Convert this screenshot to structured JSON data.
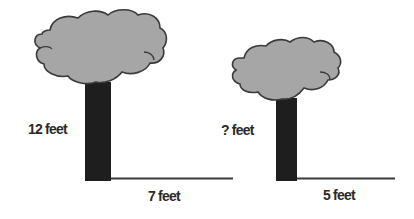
{
  "diagram": {
    "colors": {
      "canopy_fill": "#a6a6a6",
      "canopy_stroke": "#3a3a3a",
      "trunk": "#1e1e1e",
      "ground_line": "#3a3a3a",
      "label": "#2a2a2a"
    },
    "trees": [
      {
        "height_label": "12 feet",
        "shadow_label": "7 feet"
      },
      {
        "height_label": "? feet",
        "shadow_label": "5 feet"
      }
    ]
  }
}
